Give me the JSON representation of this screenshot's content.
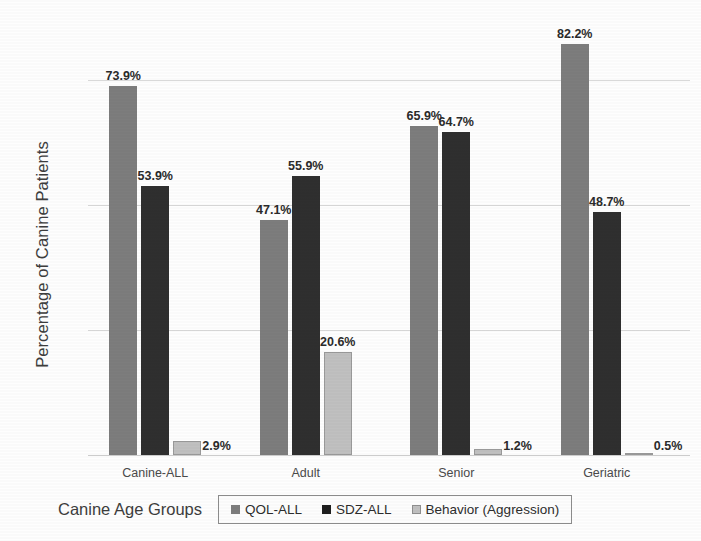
{
  "chart_data": {
    "type": "bar",
    "title": "",
    "xlabel": "Canine Age Groups",
    "ylabel": "Percentage of Canine Patients",
    "categories": [
      "Canine-ALL",
      "Adult",
      "Senior",
      "Geriatric"
    ],
    "series": [
      {
        "name": "QOL-ALL",
        "color": "#7d7d7d",
        "values": [
          73.9,
          47.1,
          65.9,
          82.2
        ],
        "labels": [
          "73.9%",
          "47.1%",
          "65.9%",
          "82.2%"
        ]
      },
      {
        "name": "SDZ-ALL",
        "color": "#2f2f2f",
        "values": [
          53.9,
          55.9,
          64.7,
          48.7
        ],
        "labels": [
          "53.9%",
          "55.9%",
          "64.7%",
          "48.7%"
        ]
      },
      {
        "name": "Behavior (Aggression)",
        "color": "#c0c0c0",
        "values": [
          2.9,
          20.6,
          1.2,
          0.5
        ],
        "labels": [
          "2.9%",
          "20.6%",
          "1.2%",
          "0.5%"
        ]
      }
    ],
    "ylim": [
      0,
      87.5
    ],
    "yticks": [
      0,
      25,
      50,
      75
    ],
    "ytick_labels": [
      "0%",
      "25%",
      "50%",
      "75%"
    ],
    "grid": true,
    "legend_position": "bottom"
  },
  "axes": {
    "y_title": "Percentage of Canine Patients",
    "x_title": "Canine Age Groups"
  },
  "legend": {
    "items": [
      {
        "label": "QOL-ALL"
      },
      {
        "label": "SDZ-ALL"
      },
      {
        "label": "Behavior (Aggression)"
      }
    ]
  }
}
